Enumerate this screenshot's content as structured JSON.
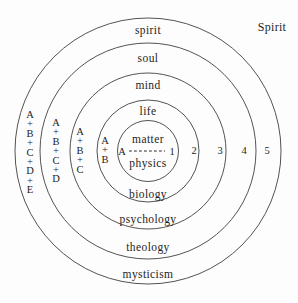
{
  "corner_label": "Spirit",
  "top_labels": [
    "spirit",
    "soul",
    "mind",
    "life"
  ],
  "center": {
    "top": "matter",
    "left": "A",
    "right": "1",
    "bottom": "physics"
  },
  "bottom_labels": [
    "biology",
    "psychology",
    "theology",
    "mysticism"
  ],
  "right_numbers": [
    "2",
    "3",
    "4",
    "5"
  ],
  "left_stacks": [
    "A\n+\nB",
    "A\n+\nB\n+\nC",
    "A\n+\nB\n+\nC\n+\nD",
    "A\n+\nB\n+\nC\n+\nD\n+\nE"
  ],
  "colors": {
    "line": "#3f3f3f",
    "text": "#1e1e1e",
    "background": "#fdfdfd"
  }
}
